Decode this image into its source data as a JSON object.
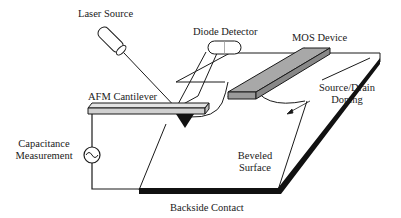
{
  "diagram": {
    "labels": {
      "laser_source": "Laser Source",
      "diode_detector": "Diode Detector",
      "mos_device": "MOS Device",
      "afm_cantilever": "AFM Cantilever",
      "source_drain_doping_line1": "Source/Drain",
      "source_drain_doping_line2": "Doping",
      "capacitance_line1": "Capacitance",
      "capacitance_line2": "Measurement",
      "beveled_line1": "Beveled",
      "beveled_line2": "Surface",
      "backside_contact": "Backside Contact"
    },
    "colors": {
      "line": "#1a1a1a",
      "mos_fill": "#8c8c8c",
      "mos_top": "#a8a8a8",
      "cantilever_fill": "#d4d4d4",
      "contact": "#111111",
      "background": "#ffffff"
    }
  }
}
